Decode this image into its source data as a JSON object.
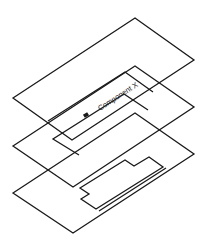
{
  "diagram": {
    "type": "exploded layer stack",
    "layers": [
      {
        "name": "top-layer",
        "label": "Component X"
      },
      {
        "name": "middle-layer",
        "label": ""
      },
      {
        "name": "bottom-layer",
        "label": ""
      }
    ],
    "component_label": "Component X",
    "colors": {
      "stroke": "#1a1a1a",
      "background": "#ffffff"
    }
  }
}
